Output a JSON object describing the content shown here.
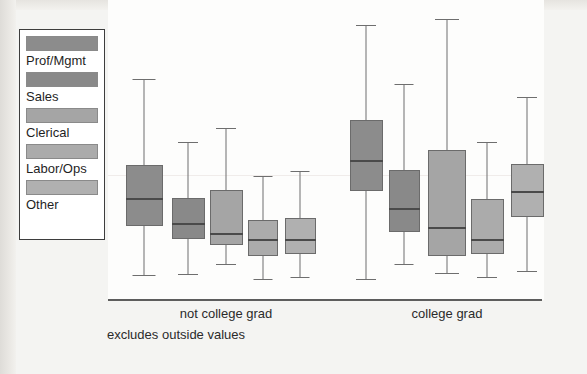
{
  "figure": {
    "note": "excludes outside values",
    "background_color": "#f4f4f2",
    "plot_background_color": "#fdfdfc",
    "axis_color": "#5d5d5d"
  },
  "legend": {
    "name": "occupation-legend",
    "items": [
      {
        "label": "Prof/Mgmt",
        "color": "#8c8c8c"
      },
      {
        "label": "Sales",
        "color": "#898989"
      },
      {
        "label": "Clerical",
        "color": "#a5a5a5"
      },
      {
        "label": "Labor/Ops",
        "color": "#ababab"
      },
      {
        "label": "Other",
        "color": "#b0b0b0"
      }
    ]
  },
  "x_axis": {
    "groups": [
      {
        "label": "not college grad",
        "center_px": 226
      },
      {
        "label": "college grad",
        "center_px": 447
      }
    ]
  },
  "chart_data": {
    "type": "box",
    "title": "",
    "xlabel": "",
    "ylabel": "",
    "grid": false,
    "legend_position": "left",
    "note": "excludes outside values",
    "group_labels": [
      "not college grad",
      "college grad"
    ],
    "series_names": [
      "Prof/Mgmt",
      "Sales",
      "Clerical",
      "Labor/Ops",
      "Other"
    ],
    "series_colors": [
      "#8c8c8c",
      "#898989",
      "#a5a5a5",
      "#ababab",
      "#b0b0b0"
    ],
    "y_axis_note": "unlabeled vertical scale; values read as pixel positions from plot top",
    "boxes": [
      {
        "group": "not college grad",
        "series": "Prof/Mgmt",
        "color": "#8c8c8c",
        "x_center_px": 144,
        "width_px": 37,
        "whisker_high_px": 79,
        "q3_px": 165,
        "median_px": 199,
        "q1_px": 226,
        "whisker_low_px": 275
      },
      {
        "group": "not college grad",
        "series": "Sales",
        "color": "#898989",
        "x_center_px": 188,
        "width_px": 33,
        "whisker_high_px": 142,
        "q3_px": 198,
        "median_px": 224,
        "q1_px": 239,
        "whisker_low_px": 274
      },
      {
        "group": "not college grad",
        "series": "Clerical",
        "color": "#a5a5a5",
        "x_center_px": 226,
        "width_px": 33,
        "whisker_high_px": 128,
        "q3_px": 190,
        "median_px": 234,
        "q1_px": 245,
        "whisker_low_px": 264
      },
      {
        "group": "not college grad",
        "series": "Labor/Ops",
        "color": "#ababab",
        "x_center_px": 263,
        "width_px": 30,
        "whisker_high_px": 176,
        "q3_px": 220,
        "median_px": 240,
        "q1_px": 256,
        "whisker_low_px": 279
      },
      {
        "group": "not college grad",
        "series": "Other",
        "color": "#b0b0b0",
        "x_center_px": 300,
        "width_px": 31,
        "whisker_high_px": 171,
        "q3_px": 218,
        "median_px": 240,
        "q1_px": 254,
        "whisker_low_px": 277
      },
      {
        "group": "college grad",
        "series": "Prof/Mgmt",
        "color": "#8c8c8c",
        "x_center_px": 366,
        "width_px": 33,
        "whisker_high_px": 25,
        "q3_px": 120,
        "median_px": 161,
        "q1_px": 191,
        "whisker_low_px": 279
      },
      {
        "group": "college grad",
        "series": "Sales",
        "color": "#898989",
        "x_center_px": 404,
        "width_px": 31,
        "whisker_high_px": 84,
        "q3_px": 170,
        "median_px": 209,
        "q1_px": 232,
        "whisker_low_px": 264
      },
      {
        "group": "college grad",
        "series": "Clerical",
        "color": "#a5a5a5",
        "x_center_px": 447,
        "width_px": 38,
        "whisker_high_px": 19,
        "q3_px": 150,
        "median_px": 228,
        "q1_px": 256,
        "whisker_low_px": 273
      },
      {
        "group": "college grad",
        "series": "Labor/Ops",
        "color": "#ababab",
        "x_center_px": 487,
        "width_px": 33,
        "whisker_high_px": 142,
        "q3_px": 199,
        "median_px": 240,
        "q1_px": 254,
        "whisker_low_px": 277
      },
      {
        "group": "college grad",
        "series": "Other",
        "color": "#b0b0b0",
        "x_center_px": 527,
        "width_px": 33,
        "whisker_high_px": 97,
        "q3_px": 164,
        "median_px": 192,
        "q1_px": 217,
        "whisker_low_px": 271
      }
    ]
  }
}
